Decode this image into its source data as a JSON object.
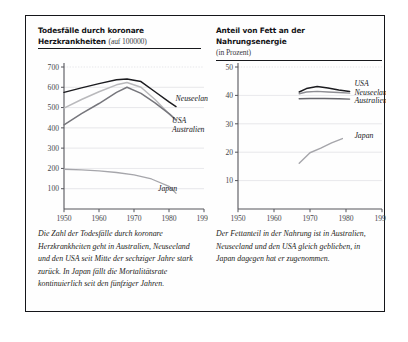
{
  "figure": {
    "panels": [
      {
        "id": "deaths-panel",
        "title_main_line1": "Todesfälle durch koronare",
        "title_main_line2": "Herzkrankheiten",
        "title_sub": "(auf 100000)",
        "caption": "Die Zahl der Todesfälle durch koronare Herzkrankheiten geht in Australien, Neuseeland und den USA seit Mitte der sechziger Jahre stark zurück. In Japan fällt die Mortalitätsrate kontinuierlich seit den fünfziger Jahren."
      },
      {
        "id": "fat-panel",
        "title_main_line1": "Anteil von Fett an der Nahrungsenergie",
        "title_main_line2": "",
        "title_sub": "(in Prozent)",
        "caption": "Der Fettanteil in der Nahrung ist in Australien, Neuseeland und den USA gleich geblieben, in Japan dagegen hat er zugenommen."
      }
    ]
  },
  "chart_data": [
    {
      "type": "line",
      "id": "deaths-chart",
      "title": "Todesfälle durch koronare Herzkrankheiten (auf 100000)",
      "xlabel": "",
      "ylabel": "",
      "xlim": [
        1950,
        1990
      ],
      "ylim": [
        0,
        700
      ],
      "xticks": [
        1950,
        1960,
        1970,
        1980,
        1990
      ],
      "yticks": [
        100,
        200,
        300,
        400,
        500,
        600,
        700
      ],
      "grid": true,
      "legend": "inline-labels",
      "series": [
        {
          "name": "Neuseeland",
          "color": "#1c1c20",
          "width": 1.5,
          "label_x": 1981,
          "label_y": 545,
          "x": [
            1950,
            1955,
            1960,
            1965,
            1968,
            1972,
            1976,
            1980,
            1982
          ],
          "y": [
            575,
            597,
            618,
            637,
            641,
            628,
            578,
            528,
            505
          ]
        },
        {
          "name": "USA",
          "color": "#b9b9bc",
          "width": 1.5,
          "label_x": 1980,
          "label_y": 437,
          "x": [
            1950,
            1955,
            1960,
            1965,
            1968,
            1972,
            1976,
            1980,
            1982
          ],
          "y": [
            497,
            540,
            578,
            612,
            624,
            600,
            540,
            470,
            437
          ]
        },
        {
          "name": "Australien",
          "color": "#76767c",
          "width": 1.5,
          "label_x": 1980,
          "label_y": 393,
          "x": [
            1950,
            1955,
            1960,
            1965,
            1968,
            1972,
            1976,
            1980,
            1982
          ],
          "y": [
            415,
            470,
            520,
            575,
            600,
            570,
            523,
            470,
            440
          ]
        },
        {
          "name": "Japan",
          "color": "#a6a6ab",
          "width": 1.3,
          "label_x": 1976,
          "label_y": 106,
          "x": [
            1950,
            1955,
            1960,
            1965,
            1970,
            1975,
            1980,
            1982
          ],
          "y": [
            196,
            193,
            188,
            180,
            168,
            148,
            112,
            78
          ]
        }
      ]
    },
    {
      "type": "line",
      "id": "fat-chart",
      "title": "Anteil von Fett an der Nahrungsenergie (in Prozent)",
      "xlabel": "",
      "ylabel": "",
      "xlim": [
        1950,
        1990
      ],
      "ylim": [
        0,
        50
      ],
      "xticks": [
        1950,
        1960,
        1970,
        1980,
        1990
      ],
      "yticks": [
        10,
        20,
        30,
        40,
        50
      ],
      "grid": true,
      "legend": "inline-labels",
      "series": [
        {
          "name": "USA",
          "color": "#1c1c20",
          "width": 1.5,
          "label_x": 1981.5,
          "label_y": 44.2,
          "x": [
            1967,
            1969,
            1972,
            1975,
            1978,
            1981
          ],
          "y": [
            41.2,
            42.4,
            43.1,
            42.6,
            41.9,
            41.4
          ]
        },
        {
          "name": "Neuseeland",
          "color": "#8e8e94",
          "width": 1.4,
          "label_x": 1981.5,
          "label_y": 41.3,
          "x": [
            1967,
            1969,
            1972,
            1975,
            1978,
            1981
          ],
          "y": [
            40.6,
            41.2,
            41.4,
            41.2,
            41.0,
            40.8
          ]
        },
        {
          "name": "Australien",
          "color": "#66666c",
          "width": 1.4,
          "label_x": 1981.5,
          "label_y": 38.4,
          "x": [
            1967,
            1970,
            1974,
            1978,
            1981
          ],
          "y": [
            38.8,
            38.9,
            38.9,
            38.8,
            38.7
          ]
        },
        {
          "name": "Japan",
          "color": "#a6a6ab",
          "width": 1.4,
          "label_x": 1981.5,
          "label_y": 26.2,
          "x": [
            1967,
            1970,
            1973,
            1976,
            1979
          ],
          "y": [
            16.1,
            19.8,
            21.4,
            23.3,
            24.8
          ]
        }
      ]
    }
  ]
}
